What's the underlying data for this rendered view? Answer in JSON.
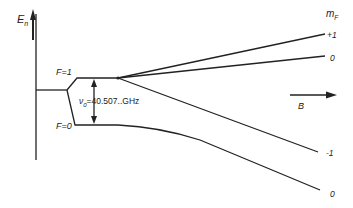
{
  "diagram": {
    "axis_label": "E",
    "axis_label_sub": "n",
    "levels": [
      {
        "label": "F=1"
      },
      {
        "label": "F=0"
      }
    ],
    "splitting": {
      "symbol": "ν",
      "symbol_sub": "0",
      "value": "=40.507..GHz"
    },
    "field_label": "B",
    "mf_header": "m",
    "mf_header_sub": "F",
    "mf_values": [
      "+1",
      "0",
      "-1",
      "0"
    ],
    "colors": {
      "line": "#222222",
      "background": "#ffffff"
    }
  }
}
